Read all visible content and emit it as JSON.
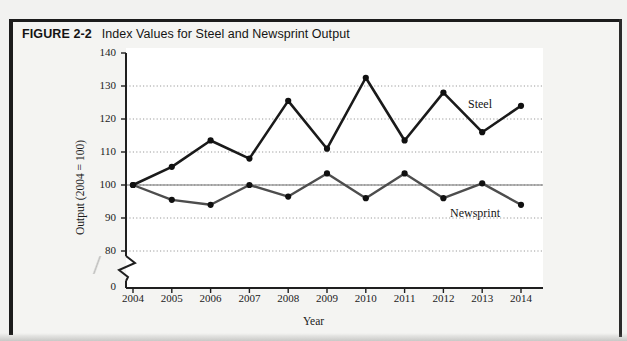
{
  "figure": {
    "label": "FIGURE 2-2",
    "title": "Index Values for Steel and Newsprint Output"
  },
  "chart_data": {
    "type": "line",
    "title": "Index Values for Steel and Newsprint Output",
    "xlabel": "Year",
    "ylabel": "Output (2004 = 100)",
    "categories": [
      "2004",
      "2005",
      "2006",
      "2007",
      "2008",
      "2009",
      "2010",
      "2011",
      "2012",
      "2013",
      "2014"
    ],
    "series": [
      {
        "name": "Steel",
        "color": "#1a1a1a",
        "values": [
          100,
          105.5,
          113.5,
          108,
          125.5,
          111,
          132.5,
          113.5,
          128,
          116,
          124
        ]
      },
      {
        "name": "Newsprint",
        "color": "#4d4d4d",
        "values": [
          100,
          95.5,
          94,
          100,
          96.5,
          103.5,
          96,
          103.5,
          96,
          100.5,
          94
        ]
      }
    ],
    "ylim": [
      80,
      140
    ],
    "yticks": [
      80,
      90,
      100,
      110,
      120,
      130,
      140
    ],
    "ytick_labels": [
      "80",
      "90",
      "100",
      "110",
      "120",
      "130",
      "140"
    ],
    "y_zero_tick": "0",
    "axis_break": true,
    "grid": true,
    "grid_style": "dotted",
    "reference_line": 100,
    "legend_position": "inline-annotation",
    "annotations": [
      {
        "text": "Steel",
        "series": "Steel"
      },
      {
        "text": "Newsprint",
        "series": "Newsprint"
      }
    ]
  }
}
